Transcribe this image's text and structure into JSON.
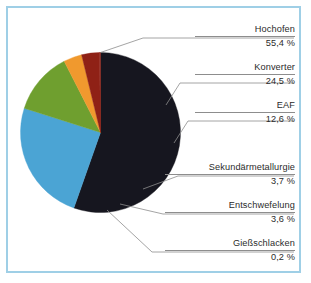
{
  "figure": {
    "border_color": "#9fcfe6",
    "background": "#ffffff",
    "leader_line_color": "#8d8d8d",
    "text_color": "#2b2b2b"
  },
  "chart_data": {
    "type": "pie",
    "title": "",
    "subtitle": "",
    "xlabel": "",
    "ylabel": "",
    "legend_position": "callout-labels-right",
    "grid": false,
    "unit": "%",
    "decimal_separator": ",",
    "start_angle_deg": 0,
    "direction": "clockwise",
    "categories": [
      "Konverter",
      "EAF",
      "Sekundärmetallurgie",
      "Entschwefelung",
      "Gießschlacken",
      "Hochofen"
    ],
    "values": [
      24.5,
      12.6,
      3.7,
      3.6,
      0.2,
      55.4
    ],
    "value_labels": [
      "24,5 %",
      "12,6 %",
      "3,7 %",
      "3,6 %",
      "0,2 %",
      "55,4 %"
    ],
    "colors": [
      "#4ba4d4",
      "#6f9f2f",
      "#f0992e",
      "#8f2116",
      "#8f2116",
      "#16161f"
    ],
    "slices": [
      {
        "label": "Hochofen",
        "value": 55.4,
        "value_label": "55,4 %",
        "color": "#16161f"
      },
      {
        "label": "Konverter",
        "value": 24.5,
        "value_label": "24,5 %",
        "color": "#4ba4d4"
      },
      {
        "label": "EAF",
        "value": 12.6,
        "value_label": "12,6 %",
        "color": "#6f9f2f"
      },
      {
        "label": "Sekundärmetallurgie",
        "value": 3.7,
        "value_label": "3,7 %",
        "color": "#f0992e"
      },
      {
        "label": "Entschwefelung",
        "value": 3.6,
        "value_label": "3,6 %",
        "color": "#8f2116"
      },
      {
        "label": "Gießschlacken",
        "value": 0.2,
        "value_label": "0,2 %",
        "color": "#8f2116"
      }
    ]
  },
  "callouts": [
    {
      "name": "Hochofen",
      "value": "55,4 %"
    },
    {
      "name": "Konverter",
      "value": "24,5 %"
    },
    {
      "name": "EAF",
      "value": "12,6 %"
    },
    {
      "name": "Sekundärmetallurgie",
      "value": "3,7 %"
    },
    {
      "name": "Entschwefelung",
      "value": "3,6 %"
    },
    {
      "name": "Gießschlacken",
      "value": "0,2 %"
    }
  ]
}
